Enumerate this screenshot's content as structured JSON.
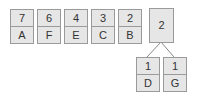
{
  "queue": [
    {
      "freq": "7",
      "symbol": "A"
    },
    {
      "freq": "6",
      "symbol": "F"
    },
    {
      "freq": "4",
      "symbol": "E"
    },
    {
      "freq": "3",
      "symbol": "C"
    },
    {
      "freq": "2",
      "symbol": "B"
    }
  ],
  "tree": {
    "root": {
      "freq": "2"
    },
    "children": [
      {
        "freq": "1",
        "symbol": "D"
      },
      {
        "freq": "1",
        "symbol": "G"
      }
    ]
  },
  "colors": {
    "fill": "#e6e6e6",
    "border": "#9a9a9a",
    "text": "#333333",
    "edge": "#888888"
  }
}
